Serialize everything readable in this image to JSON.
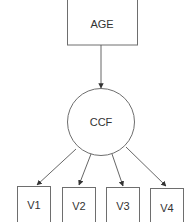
{
  "diagram": {
    "type": "path-diagram",
    "nodes": [
      {
        "id": "age",
        "label": "AGE",
        "shape": "rectangle"
      },
      {
        "id": "ccf",
        "label": "CCF",
        "shape": "circle"
      },
      {
        "id": "v1",
        "label": "V1",
        "shape": "rectangle"
      },
      {
        "id": "v2",
        "label": "V2",
        "shape": "rectangle"
      },
      {
        "id": "v3",
        "label": "V3",
        "shape": "rectangle"
      },
      {
        "id": "v4",
        "label": "V4",
        "shape": "rectangle"
      }
    ],
    "edges": [
      {
        "from": "AGE",
        "to": "CCF"
      },
      {
        "from": "CCF",
        "to": "V1"
      },
      {
        "from": "CCF",
        "to": "V2"
      },
      {
        "from": "CCF",
        "to": "V3"
      },
      {
        "from": "CCF",
        "to": "V4"
      }
    ]
  }
}
